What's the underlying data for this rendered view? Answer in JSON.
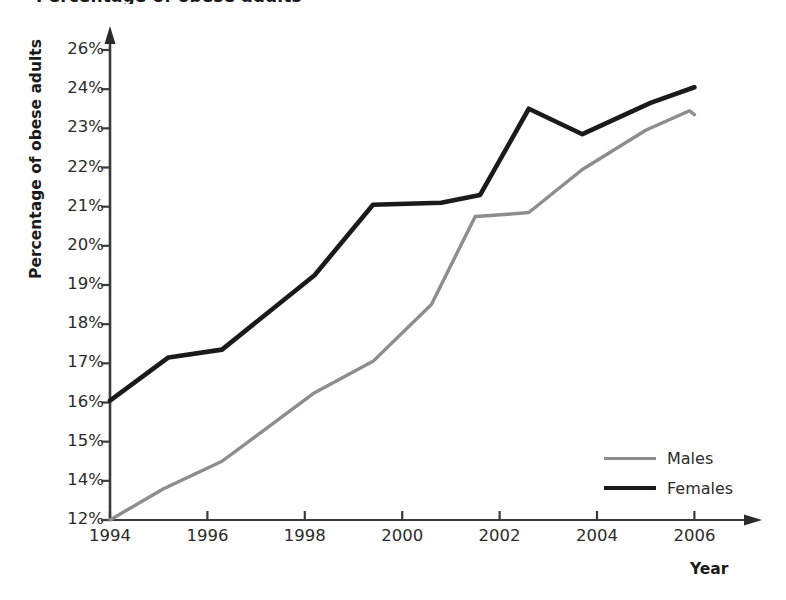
{
  "chart_data": {
    "type": "line",
    "title": "Percentage of obese adults",
    "xlabel": "Year",
    "ylabel": "Percentage of obese adults",
    "grid": false,
    "legend_position": "lower-right",
    "xlim": [
      1994,
      2006
    ],
    "ylim": [
      12,
      26
    ],
    "xticks": [
      "1994",
      "1996",
      "1998",
      "2000",
      "2002",
      "2004",
      "2006"
    ],
    "xtick_values": [
      1994,
      1996,
      1998,
      2000,
      2002,
      2004,
      2006
    ],
    "yticks": [
      "26%",
      "24%",
      "23%",
      "22%",
      "21%",
      "20%",
      "19%",
      "18%",
      "17%",
      "16%",
      "15%",
      "14%",
      "12%"
    ],
    "ytick_values": [
      26,
      24,
      23,
      22,
      21,
      20,
      19,
      18,
      17,
      16,
      15,
      14,
      12
    ],
    "series": [
      {
        "name": "Males",
        "color": "#8d8d8d",
        "x": [
          1994,
          1995.1,
          1996.3,
          1998.2,
          1999.4,
          2000.6,
          2001.5,
          2002.1,
          2002.6,
          2003.7,
          2005.0,
          2005.9,
          2006.0
        ],
        "values": [
          12.0,
          13.6,
          14.5,
          16.25,
          17.05,
          18.5,
          20.75,
          20.8,
          20.85,
          21.95,
          22.95,
          23.45,
          23.35
        ]
      },
      {
        "name": "Females",
        "color": "#1a1a1a",
        "x": [
          1994,
          1995.2,
          1996.3,
          1998.2,
          1999.4,
          2000.8,
          2001.6,
          2002.6,
          2003.7,
          2005.1,
          2006.0
        ],
        "values": [
          16.05,
          17.15,
          17.35,
          19.25,
          21.05,
          21.1,
          21.3,
          23.5,
          22.85,
          23.65,
          24.1
        ]
      }
    ]
  },
  "legend": {
    "items": [
      {
        "label": "Males"
      },
      {
        "label": "Females"
      }
    ]
  },
  "axis": {
    "x_title": "Year",
    "y_title": "Percentage of obese adults"
  }
}
